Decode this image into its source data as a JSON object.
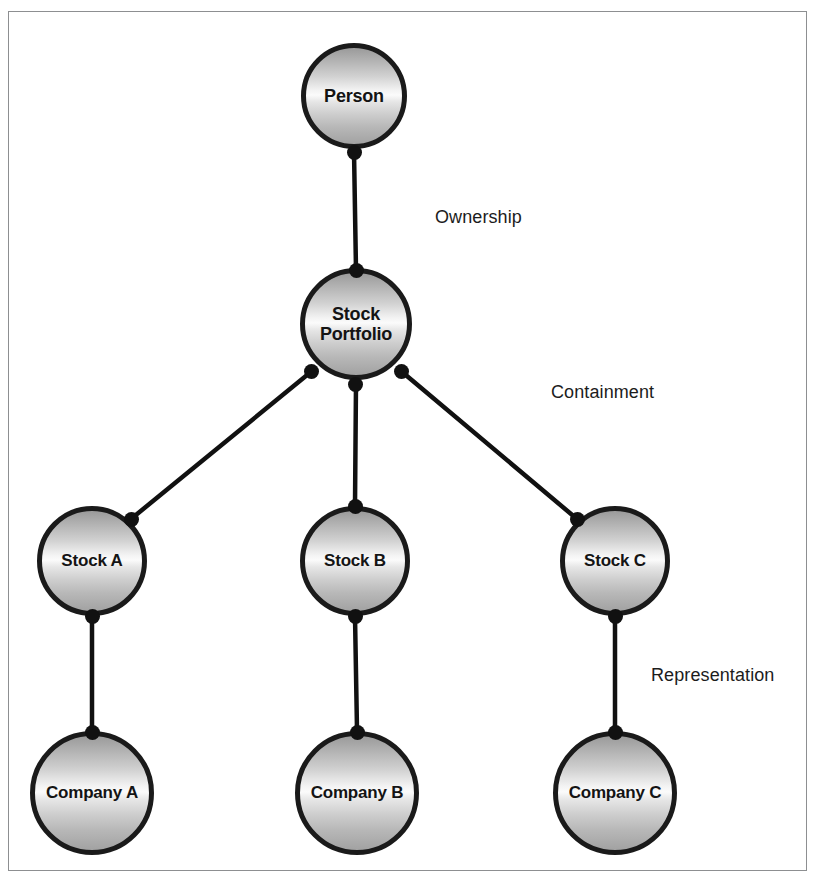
{
  "diagram": {
    "background_color": "#ffffff",
    "frame_color": "#8d8f91",
    "node_outline_color": "#1a1a1a",
    "connector_color": "#111111",
    "nodes": [
      {
        "id": "person",
        "label": "Person",
        "cx": 354,
        "cy": 96,
        "r": 53
      },
      {
        "id": "portfolio",
        "label": "Stock\nPortfolio",
        "cx": 356,
        "cy": 324,
        "r": 56,
        "line1": "Stock",
        "line2": "Portfolio"
      },
      {
        "id": "stock_a",
        "label": "Stock A",
        "cx": 92,
        "cy": 561,
        "r": 55
      },
      {
        "id": "stock_b",
        "label": "Stock B",
        "cx": 355,
        "cy": 561,
        "r": 55
      },
      {
        "id": "stock_c",
        "label": "Stock C",
        "cx": 615,
        "cy": 561,
        "r": 55
      },
      {
        "id": "company_a",
        "label": "Company A",
        "cx": 92,
        "cy": 793,
        "r": 62
      },
      {
        "id": "company_b",
        "label": "Company B",
        "cx": 357,
        "cy": 793,
        "r": 62
      },
      {
        "id": "company_c",
        "label": "Company C",
        "cx": 615,
        "cy": 793,
        "r": 62
      }
    ],
    "edges": [
      {
        "id": "person-portfolio",
        "from": "person",
        "to": "portfolio",
        "relationship": "Ownership"
      },
      {
        "id": "portfolio-stock-a",
        "from": "portfolio",
        "to": "stock_a",
        "relationship": "Containment"
      },
      {
        "id": "portfolio-stock-b",
        "from": "portfolio",
        "to": "stock_b",
        "relationship": "Containment"
      },
      {
        "id": "portfolio-stock-c",
        "from": "portfolio",
        "to": "stock_c",
        "relationship": "Containment"
      },
      {
        "id": "stock-a-company-a",
        "from": "stock_a",
        "to": "company_a",
        "relationship": "Representation"
      },
      {
        "id": "stock-b-company-b",
        "from": "stock_b",
        "to": "company_b",
        "relationship": "Representation"
      },
      {
        "id": "stock-c-company-c",
        "from": "stock_c",
        "to": "company_c",
        "relationship": "Representation"
      }
    ],
    "relationship_labels": [
      {
        "id": "ownership",
        "text": "Ownership",
        "x": 435,
        "y": 207
      },
      {
        "id": "containment",
        "text": "Containment",
        "x": 551,
        "y": 382
      },
      {
        "id": "representation",
        "text": "Representation",
        "x": 651,
        "y": 665
      }
    ]
  }
}
